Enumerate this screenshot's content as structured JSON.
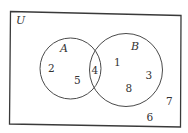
{
  "diagram": {
    "type": "venn",
    "universe": {
      "label": "U",
      "outside_elements": [
        "6",
        "7"
      ]
    },
    "sets": [
      {
        "label": "A",
        "only_elements": [
          "2",
          "5"
        ]
      },
      {
        "label": "B",
        "only_elements": [
          "1",
          "3",
          "8"
        ]
      }
    ],
    "intersection": {
      "sets": [
        "A",
        "B"
      ],
      "elements": [
        "4"
      ]
    },
    "labels": {
      "u": "U",
      "a": "A",
      "b": "B",
      "e1": "1",
      "e2": "2",
      "e3": "3",
      "e4": "4",
      "e5": "5",
      "e6": "6",
      "e7": "7",
      "e8": "8"
    },
    "colors": {
      "stroke": "#3a3a3a",
      "text": "#333333",
      "background": "#ffffff"
    }
  }
}
